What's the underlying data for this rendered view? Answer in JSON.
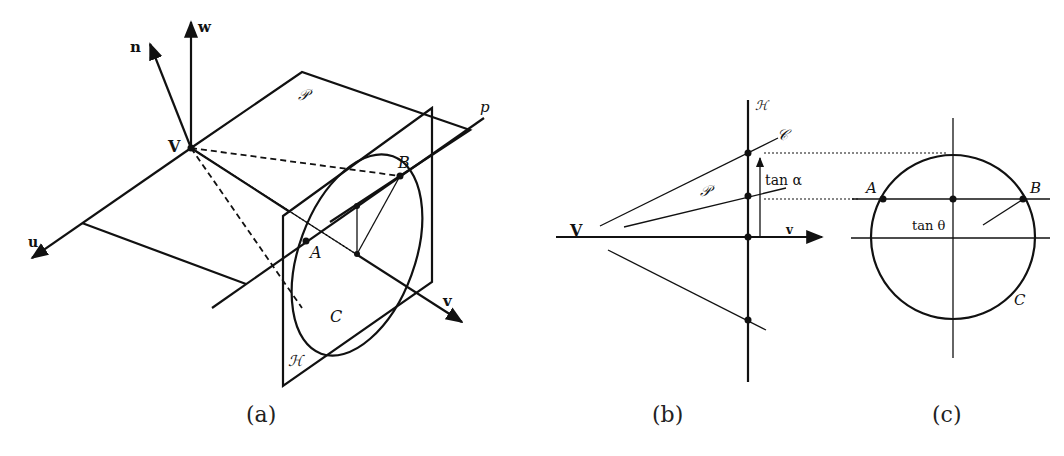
{
  "figure": {
    "panel_a": {
      "caption": "(a)",
      "labels": {
        "n": "n",
        "w": "w",
        "u": "u",
        "v": "v",
        "V": "V",
        "plane_P": "𝒫",
        "plane_H": "ℋ",
        "line_p": "p",
        "A": "A",
        "B": "B",
        "C": "C"
      }
    },
    "panel_b": {
      "caption": "(b)",
      "labels": {
        "H": "ℋ",
        "C": "𝒞",
        "P": "𝒫",
        "tan_alpha": "tan α",
        "V": "V",
        "v": "v"
      }
    },
    "panel_c": {
      "caption": "(c)",
      "labels": {
        "A": "A",
        "B": "B",
        "C": "C",
        "tan_theta": "tan θ"
      }
    }
  }
}
